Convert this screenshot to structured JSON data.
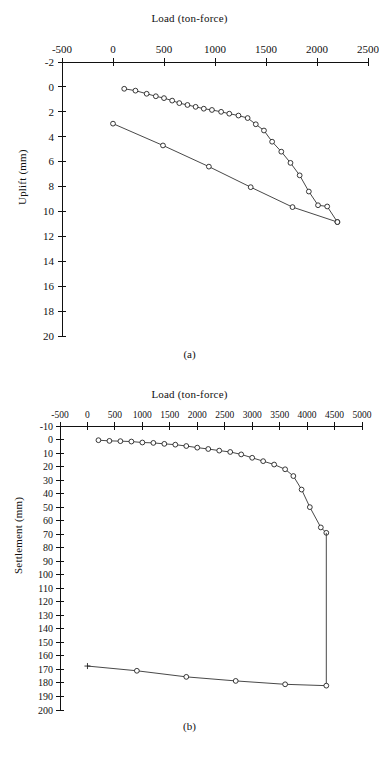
{
  "figure": {
    "panel_a": {
      "caption": "(a)",
      "title": "Load (ton-force)",
      "ylabel": "Uplift (mm)"
    },
    "panel_b": {
      "caption": "(b)",
      "title": "Load (ton-force)",
      "ylabel": "Settlement (mm)"
    }
  },
  "chart_data": [
    {
      "id": "panel-a",
      "type": "line",
      "title": "Load (ton-force)",
      "caption": "(a)",
      "xlabel": "Load (ton-force)",
      "ylabel": "Uplift (mm)",
      "xlim": [
        -500,
        2500
      ],
      "ylim": [
        -2,
        20
      ],
      "y_inverted": true,
      "x_axis_position": "top",
      "grid": false,
      "legend": "none",
      "xticks": [
        -500,
        0,
        500,
        1000,
        1500,
        2000,
        2500
      ],
      "xtick_labels": [
        "-500",
        "0",
        "500",
        "1000",
        "1500",
        "2000",
        "2500"
      ],
      "yticks": [
        -2,
        0,
        2,
        4,
        6,
        8,
        10,
        12,
        14,
        16,
        18,
        20
      ],
      "ytick_labels": [
        "-2",
        "0",
        "2",
        "4",
        "6",
        "8",
        "10",
        "12",
        "14",
        "16",
        "18",
        "20"
      ],
      "series": [
        {
          "name": "loading",
          "marker": "circle",
          "x": [
            110,
            220,
            330,
            420,
            500,
            580,
            650,
            730,
            810,
            890,
            970,
            1060,
            1140,
            1230,
            1320,
            1400,
            1480,
            1560,
            1650,
            1740,
            1830,
            1920,
            2010,
            2100,
            2200
          ],
          "y": [
            0.15,
            0.3,
            0.55,
            0.75,
            0.9,
            1.1,
            1.3,
            1.45,
            1.6,
            1.75,
            1.85,
            2.0,
            2.15,
            2.3,
            2.5,
            3.0,
            3.5,
            4.4,
            5.2,
            6.1,
            7.1,
            8.4,
            9.5,
            9.6,
            10.85
          ]
        },
        {
          "name": "unloading",
          "marker": "circle",
          "x": [
            0,
            490,
            940,
            1350,
            1760,
            2200
          ],
          "y": [
            2.95,
            4.7,
            6.4,
            8.05,
            9.65,
            10.85
          ]
        }
      ]
    },
    {
      "id": "panel-b",
      "type": "line",
      "title": "Load (ton-force)",
      "caption": "(b)",
      "xlabel": "Load (ton-force)",
      "ylabel": "Settlement (mm)",
      "xlim": [
        -500,
        5000
      ],
      "ylim": [
        -10,
        200
      ],
      "y_inverted": true,
      "x_axis_position": "top",
      "grid": false,
      "legend": "none",
      "xticks": [
        -500,
        0,
        500,
        1000,
        1500,
        2000,
        2500,
        3000,
        3500,
        4000,
        4500,
        5000
      ],
      "xtick_labels": [
        "-500",
        "0",
        "500",
        "1000",
        "1500",
        "2000",
        "2500",
        "3000",
        "3500",
        "4000",
        "4500",
        "5000"
      ],
      "yticks": [
        -10,
        0,
        10,
        20,
        30,
        40,
        50,
        60,
        70,
        80,
        90,
        100,
        110,
        120,
        130,
        140,
        150,
        160,
        170,
        180,
        190,
        200
      ],
      "ytick_labels": [
        "-10",
        "0",
        "10",
        "20",
        "30",
        "40",
        "50",
        "60",
        "70",
        "80",
        "90",
        "100",
        "110",
        "120",
        "130",
        "140",
        "150",
        "160",
        "170",
        "180",
        "190",
        "200"
      ],
      "series": [
        {
          "name": "loading",
          "marker": "circle",
          "x": [
            200,
            400,
            600,
            800,
            1000,
            1200,
            1400,
            1600,
            1800,
            2000,
            2200,
            2400,
            2600,
            2800,
            3000,
            3200,
            3400,
            3600,
            3750,
            3900,
            4050,
            4250,
            4350
          ],
          "y": [
            0.5,
            1.0,
            1.2,
            1.5,
            2.2,
            2.5,
            3.2,
            3.8,
            4.8,
            6.0,
            7.0,
            8.2,
            9.2,
            11.0,
            13.5,
            16.0,
            18.5,
            22.0,
            27.0,
            37.0,
            50.0,
            65.0,
            69.0
          ]
        },
        {
          "name": "plunge",
          "marker": "none",
          "x": [
            4350,
            4350
          ],
          "y": [
            69.0,
            182.0
          ]
        },
        {
          "name": "rebound",
          "marker": "circle",
          "first_marker": "plus",
          "x": [
            0,
            900,
            1800,
            2700,
            3600,
            4350
          ],
          "y": [
            167.5,
            171.0,
            175.5,
            178.5,
            181.0,
            182.0
          ]
        }
      ]
    }
  ]
}
